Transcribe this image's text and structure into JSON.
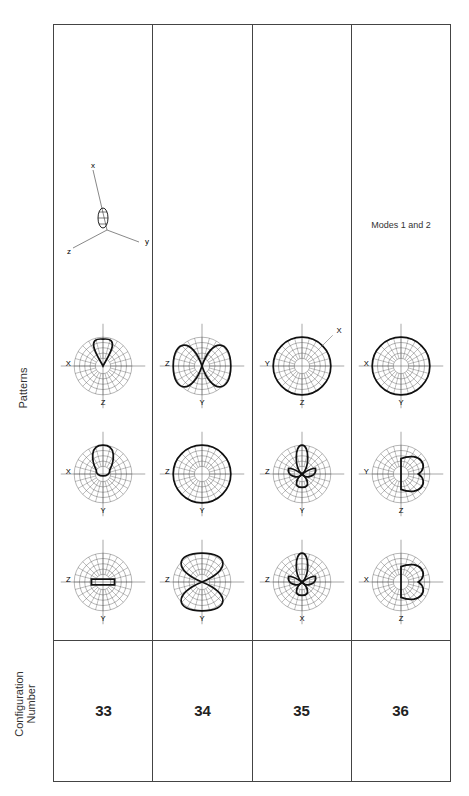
{
  "header": {
    "config_label": "Configuration\nNumber",
    "config_label_line1": "Configuration",
    "config_label_line2": "Number",
    "patterns_label": "Patterns"
  },
  "rows": [
    {
      "config": "33",
      "patterns": [
        {
          "h": "Y",
          "v": "Z",
          "shape": "flat-lobe"
        },
        {
          "h": "Y",
          "v": "X",
          "shape": "forward-lobe-narrow"
        },
        {
          "h": "Z",
          "v": "X",
          "shape": "forward-lobe"
        }
      ],
      "extra": {
        "type": "3d-axes",
        "labels": [
          "x",
          "y",
          "z"
        ]
      }
    },
    {
      "config": "34",
      "patterns": [
        {
          "h": "Y",
          "v": "Z",
          "shape": "side-lobes"
        },
        {
          "h": "Y",
          "v": "Z",
          "shape": "omni"
        },
        {
          "h": "Y",
          "v": "Z",
          "shape": "up-down-lobes"
        }
      ],
      "extra": null
    },
    {
      "config": "35",
      "patterns": [
        {
          "h": "X",
          "v": "Z",
          "shape": "multi-lobe"
        },
        {
          "h": "Y",
          "v": "Z",
          "shape": "multi-lobe"
        },
        {
          "h": "Z",
          "v": "Y",
          "shape": "omni",
          "diag": "X"
        }
      ],
      "extra": null
    },
    {
      "config": "36",
      "patterns": [
        {
          "h": "Z",
          "v": "X",
          "shape": "cardioid-left"
        },
        {
          "h": "Z",
          "v": "Y",
          "shape": "cardioid-left"
        },
        {
          "h": "Y",
          "v": "X",
          "shape": "omni"
        }
      ],
      "extra": {
        "type": "text",
        "text": "Modes 1 and 2"
      }
    }
  ],
  "colors": {
    "border": "#444444",
    "grid": "#555555",
    "pattern": "#111111"
  }
}
